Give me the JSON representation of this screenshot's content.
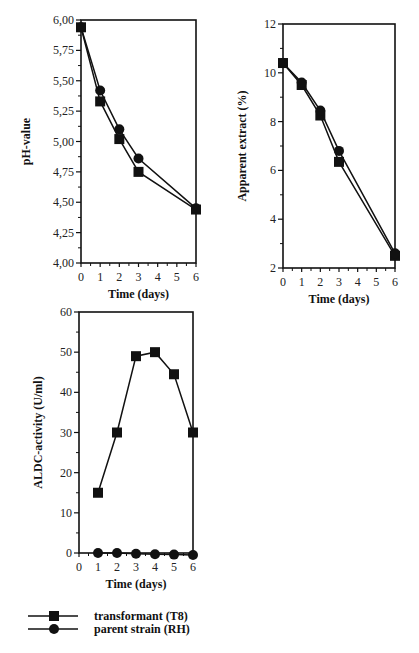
{
  "chart_data": [
    {
      "id": "ph",
      "type": "line",
      "title": "",
      "xlabel": "Time (days)",
      "ylabel": "pH-value",
      "x_ticks": [
        "0",
        "1",
        "2",
        "3",
        "4",
        "5",
        "6"
      ],
      "y_ticks": [
        "4,00",
        "4,25",
        "4,50",
        "4,75",
        "5,00",
        "5,25",
        "5,50",
        "5,75",
        "6,00"
      ],
      "xlim": [
        0,
        6
      ],
      "ylim": [
        4.0,
        6.0
      ],
      "grid": false,
      "series": [
        {
          "name": "transformant (T8)",
          "marker": "square",
          "x": [
            0,
            1,
            2,
            3,
            6
          ],
          "values": [
            5.94,
            5.33,
            5.02,
            4.75,
            4.44
          ]
        },
        {
          "name": "parent strain (RH)",
          "marker": "circle",
          "x": [
            0,
            1,
            2,
            3,
            6
          ],
          "values": [
            5.94,
            5.42,
            5.1,
            4.86,
            4.45
          ]
        }
      ]
    },
    {
      "id": "extract",
      "type": "line",
      "title": "",
      "xlabel": "Time (days)",
      "ylabel": "Apparent extract  (%)",
      "x_ticks": [
        "0",
        "1",
        "2",
        "3",
        "4",
        "5",
        "6"
      ],
      "y_ticks": [
        "2",
        "4",
        "6",
        "8",
        "10",
        "12"
      ],
      "xlim": [
        0,
        6
      ],
      "ylim": [
        2,
        12
      ],
      "grid": false,
      "series": [
        {
          "name": "transformant (T8)",
          "marker": "square",
          "x": [
            0,
            1,
            2,
            3,
            6
          ],
          "values": [
            10.4,
            9.5,
            8.25,
            6.35,
            2.5
          ]
        },
        {
          "name": "parent strain (RH)",
          "marker": "circle",
          "x": [
            0,
            1,
            2,
            3,
            6
          ],
          "values": [
            10.4,
            9.6,
            8.45,
            6.8,
            2.6
          ]
        }
      ]
    },
    {
      "id": "aldc",
      "type": "line",
      "title": "",
      "xlabel": "Time (days)",
      "ylabel": "ALDC-activity  (U/ml)",
      "x_ticks": [
        "0",
        "1",
        "2",
        "3",
        "4",
        "5",
        "6"
      ],
      "y_ticks": [
        "0",
        "10",
        "20",
        "30",
        "40",
        "50",
        "60"
      ],
      "xlim": [
        0,
        6
      ],
      "ylim": [
        0,
        60
      ],
      "grid": false,
      "series": [
        {
          "name": "transformant (T8)",
          "marker": "square",
          "x": [
            1,
            2,
            3,
            4,
            5,
            6
          ],
          "values": [
            15,
            30,
            49,
            50,
            44.5,
            30
          ]
        },
        {
          "name": "parent strain (RH)",
          "marker": "circle",
          "x": [
            1,
            2,
            3,
            4,
            5,
            6
          ],
          "values": [
            0,
            0,
            -0.2,
            -0.3,
            -0.4,
            -0.5
          ]
        }
      ]
    }
  ],
  "legend": {
    "position": "bottom-left",
    "items": [
      {
        "label": "transformant (T8)",
        "marker": "square"
      },
      {
        "label": "parent strain (RH)",
        "marker": "circle"
      }
    ]
  },
  "colors": {
    "ink": "#111111",
    "background": "#ffffff"
  }
}
